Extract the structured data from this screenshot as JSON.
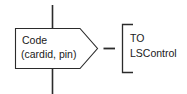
{
  "diagram": {
    "type": "message-flow-notation",
    "background_color": "#ffffff",
    "stroke_color": "#2b2b2b",
    "text_color": "#1a1a1a",
    "message_box": {
      "shape": "pentagon-arrow",
      "label_line1": "Code",
      "label_line2": "(cardid, pin)",
      "parameters": [
        "cardid",
        "pin"
      ],
      "message_name": "Code"
    },
    "lifeline": {
      "orientation": "vertical",
      "passes_through_box": true
    },
    "connector": {
      "glyph": "—",
      "style": "dash"
    },
    "destination": {
      "bracket": "left-square-bracket",
      "label_line1": "TO",
      "label_line2": "LSControl",
      "keyword": "TO",
      "target": "LSControl"
    }
  }
}
